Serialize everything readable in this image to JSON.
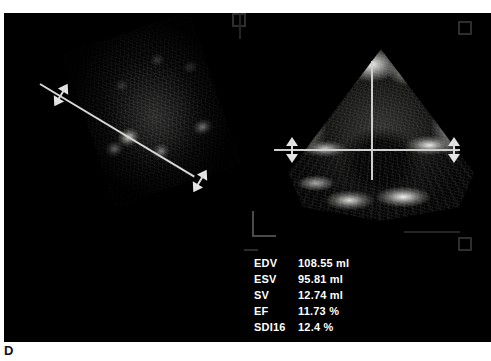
{
  "figure": {
    "caption": "D"
  },
  "panels": {
    "left": {
      "name": "short-axis-slice",
      "caliper_line": "diagonal-measurement-line",
      "arrows": [
        "caliper-arrow-upper-left",
        "caliper-arrow-lower-right"
      ]
    },
    "right": {
      "name": "apical-sector-scan",
      "crosshair_horizontal": "horizontal-measurement-line",
      "crosshair_vertical": "vertical-measurement-line",
      "arrows": [
        "caliper-arrow-left",
        "caliper-arrow-right"
      ]
    }
  },
  "measurements": {
    "rows": [
      {
        "label": "EDV",
        "value": "108.55 ml"
      },
      {
        "label": "ESV",
        "value": "95.81 ml"
      },
      {
        "label": "SV",
        "value": "12.74 ml"
      },
      {
        "label": "EF",
        "value": "11.73 %"
      },
      {
        "label": "SDI16",
        "value": "12.4 %"
      }
    ]
  },
  "colors": {
    "background": "#000000",
    "page": "#ffffff",
    "text": "#ffffff",
    "caliper": "#d8d8d8",
    "caption": "#111111"
  }
}
